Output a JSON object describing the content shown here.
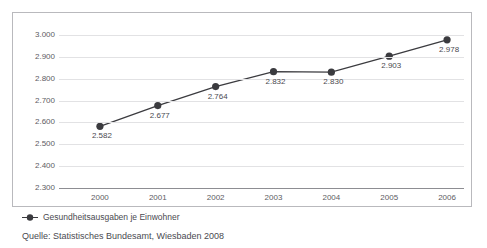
{
  "chart_data": {
    "type": "line",
    "title": "im Zeitraum 2000 bis 2006",
    "xlabel": "",
    "ylabel": "",
    "categories": [
      "2000",
      "2001",
      "2002",
      "2003",
      "2004",
      "2005",
      "2006"
    ],
    "series": [
      {
        "name": "Gesundheitsausgaben je Einwohner",
        "values": [
          2582,
          2677,
          2764,
          2832,
          2830,
          2903,
          2978
        ],
        "value_labels": [
          "2.582",
          "2.677",
          "2.764",
          "2.832",
          "2.830",
          "2.903",
          "2.978"
        ],
        "color": "#3b3b3f",
        "marker": "circle"
      }
    ],
    "ylim": [
      2300,
      3000
    ],
    "ytick_labels": [
      "3.000",
      "2.900",
      "2.800",
      "2.700",
      "2.600",
      "2.500",
      "2.400",
      "2.300"
    ],
    "ytick_values": [
      3000,
      2900,
      2800,
      2700,
      2600,
      2500,
      2400,
      2300
    ],
    "grid": true,
    "legend_position": "bottom-left"
  },
  "legend": {
    "marker_icon": "series-marker-icon",
    "label": "Gesundheitsausgaben je Einwohner"
  },
  "source": {
    "text": "Quelle: Statistisches Bundesamt, Wiesbaden 2008"
  },
  "colors": {
    "series": "#3b3b3f",
    "gridline": "#e2e2e4",
    "axis": "#8d8d92",
    "frame": "#b9b9bd",
    "text": "#4a4a50"
  }
}
